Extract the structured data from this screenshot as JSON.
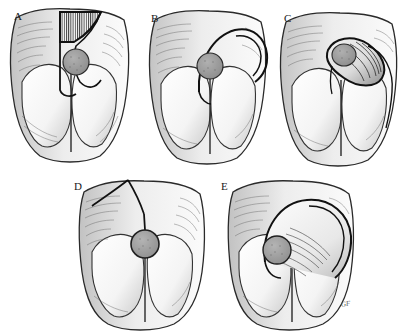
{
  "figure": {
    "background_color": "#ffffff",
    "ink_color": "#1a1a1a",
    "lesion_color": "#9a9a9a",
    "hatch_color": "#2b2b2b",
    "signature": "GF",
    "panel_count": 5
  },
  "panels": [
    {
      "id": "A",
      "label": "A",
      "caption": "Planned flap outline with hatched excision wedge over the sacral defect",
      "lesion": {
        "present": true,
        "shape": "circle",
        "fill": "#9a9a9a"
      },
      "hatching": {
        "present": true,
        "style": "vertical-line",
        "shape": "triangle"
      },
      "flap_outline": "upper-wedge"
    },
    {
      "id": "B",
      "label": "B",
      "caption": "Curved rotation flap incision arcing laterally to the right",
      "lesion": {
        "present": true,
        "shape": "circle",
        "fill": "#9a9a9a"
      },
      "hatching": {
        "present": false,
        "style": "",
        "shape": ""
      },
      "flap_outline": "double-arc-right"
    },
    {
      "id": "C",
      "label": "C",
      "caption": "Flap elevated and rotated; oblique island with shaded undersurface",
      "lesion": {
        "present": true,
        "shape": "circle",
        "fill": "#9a9a9a"
      },
      "hatching": {
        "present": false,
        "style": "",
        "shape": ""
      },
      "flap_outline": "oblique-island"
    },
    {
      "id": "D",
      "label": "D",
      "caption": "Y-shaped incision converging to the circular defect",
      "lesion": {
        "present": true,
        "shape": "circle",
        "fill": "#9a9a9a"
      },
      "hatching": {
        "present": false,
        "style": "",
        "shape": ""
      },
      "flap_outline": "y-limb"
    },
    {
      "id": "E",
      "label": "E",
      "caption": "Large dome rotation flap advanced over the defect",
      "lesion": {
        "present": true,
        "shape": "circle",
        "fill": "#9a9a9a"
      },
      "hatching": {
        "present": false,
        "style": "",
        "shape": ""
      },
      "flap_outline": "dome-rotation"
    }
  ]
}
